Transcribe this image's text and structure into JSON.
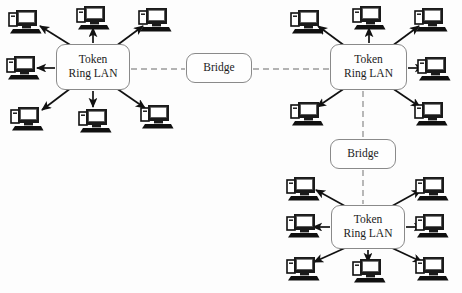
{
  "diagram": {
    "type": "network-topology",
    "background_color": "#fdfdfd",
    "node_border_color": "#8a8a8a",
    "solid_link_color": "#111111",
    "dashed_link_color": "#9a9a9a",
    "labels": {
      "lan": "Token Ring LAN",
      "lan_line1": "Token",
      "lan_line2": "Ring LAN",
      "bridge": "Bridge"
    },
    "nodes": [
      {
        "id": "lan-left",
        "kind": "lan",
        "label_line1": "Token",
        "label_line2": "Ring LAN",
        "x": 56,
        "y": 44,
        "w": 74,
        "h": 46
      },
      {
        "id": "bridge-top",
        "kind": "bridge",
        "label": "Bridge",
        "x": 186,
        "y": 53,
        "w": 66,
        "h": 30
      },
      {
        "id": "lan-right",
        "kind": "lan",
        "label_line1": "Token",
        "label_line2": "Ring LAN",
        "x": 330,
        "y": 44,
        "w": 77,
        "h": 46
      },
      {
        "id": "bridge-bottom",
        "kind": "bridge",
        "label": "Bridge",
        "x": 330,
        "y": 139,
        "w": 66,
        "h": 30
      },
      {
        "id": "lan-bottom",
        "kind": "lan",
        "label_line1": "Token",
        "label_line2": "Ring LAN",
        "x": 331,
        "y": 205,
        "w": 74,
        "h": 44
      }
    ],
    "dashed_links": [
      {
        "id": "link-lan-left-bridge-top",
        "from": "lan-left",
        "to": "bridge-top",
        "x1": 131,
        "y1": 69,
        "x2": 185,
        "y2": 69
      },
      {
        "id": "link-bridge-top-lan-right",
        "from": "bridge-top",
        "to": "lan-right",
        "x1": 253,
        "y1": 69,
        "x2": 329,
        "y2": 69
      },
      {
        "id": "link-lan-right-bridge-bottom",
        "from": "lan-right",
        "to": "bridge-bottom",
        "x1": 363,
        "y1": 91,
        "x2": 363,
        "y2": 138
      },
      {
        "id": "link-bridge-bottom-lan-bottom",
        "from": "bridge-bottom",
        "to": "lan-bottom",
        "x1": 363,
        "y1": 170,
        "x2": 363,
        "y2": 204
      }
    ],
    "clusters": [
      {
        "id": "cluster-left",
        "lan": "lan-left",
        "station_count": 6,
        "stations": [
          {
            "id": "pc-left-tl",
            "x": 8,
            "y": 8,
            "arrow_from": [
              72,
              46
            ],
            "arrow_to": [
              40,
              26
            ]
          },
          {
            "id": "pc-left-tc",
            "x": 76,
            "y": 4,
            "arrow_from": [
              93,
              43
            ],
            "arrow_to": [
              93,
              28
            ]
          },
          {
            "id": "pc-left-tr",
            "x": 138,
            "y": 6,
            "arrow_from": [
              116,
              46
            ],
            "arrow_to": [
              143,
              26
            ]
          },
          {
            "id": "pc-left-ml",
            "x": 6,
            "y": 54,
            "arrow_from": [
              55,
              68
            ],
            "arrow_to": [
              37,
              68
            ]
          },
          {
            "id": "pc-left-bl",
            "x": 10,
            "y": 105,
            "arrow_from": [
              71,
              88
            ],
            "arrow_to": [
              42,
              110
            ]
          },
          {
            "id": "pc-left-bc",
            "x": 78,
            "y": 107,
            "arrow_from": [
              93,
              91
            ],
            "arrow_to": [
              93,
              107
            ]
          },
          {
            "id": "pc-left-br",
            "x": 140,
            "y": 103,
            "arrow_from": [
              116,
              88
            ],
            "arrow_to": [
              145,
              108
            ]
          }
        ]
      },
      {
        "id": "cluster-right",
        "lan": "lan-right",
        "station_count": 6,
        "stations": [
          {
            "id": "pc-right-tl",
            "x": 290,
            "y": 8,
            "arrow_from": [
              345,
              46
            ],
            "arrow_to": [
              318,
              26
            ]
          },
          {
            "id": "pc-right-tc",
            "x": 352,
            "y": 4,
            "arrow_from": [
              369,
              43
            ],
            "arrow_to": [
              369,
              28
            ]
          },
          {
            "id": "pc-right-tr",
            "x": 414,
            "y": 6,
            "arrow_from": [
              392,
              46
            ],
            "arrow_to": [
              419,
              26
            ]
          },
          {
            "id": "pc-right-mr",
            "x": 417,
            "y": 55,
            "arrow_from": [
              408,
              68
            ],
            "arrow_to": [
              424,
              68
            ]
          },
          {
            "id": "pc-right-bl",
            "x": 290,
            "y": 100,
            "arrow_from": [
              345,
              88
            ],
            "arrow_to": [
              317,
              107
            ]
          },
          {
            "id": "pc-right-br",
            "x": 414,
            "y": 100,
            "arrow_from": [
              392,
              88
            ],
            "arrow_to": [
              420,
              107
            ]
          }
        ]
      },
      {
        "id": "cluster-bottom",
        "lan": "lan-bottom",
        "station_count": 8,
        "stations": [
          {
            "id": "pc-bottom-tl",
            "x": 286,
            "y": 175,
            "arrow_from": [
              345,
              206
            ],
            "arrow_to": [
              316,
              190
            ]
          },
          {
            "id": "pc-bottom-tr",
            "x": 415,
            "y": 175,
            "arrow_from": [
              392,
              206
            ],
            "arrow_to": [
              421,
              190
            ]
          },
          {
            "id": "pc-bottom-ml",
            "x": 286,
            "y": 212,
            "arrow_from": [
              330,
              227
            ],
            "arrow_to": [
              313,
              227
            ]
          },
          {
            "id": "pc-bottom-mr",
            "x": 415,
            "y": 212,
            "arrow_from": [
              406,
              227
            ],
            "arrow_to": [
              423,
              227
            ]
          },
          {
            "id": "pc-bottom-bl",
            "x": 286,
            "y": 255,
            "arrow_from": [
              345,
              248
            ],
            "arrow_to": [
              314,
              262
            ]
          },
          {
            "id": "pc-bottom-bc",
            "x": 352,
            "y": 257,
            "arrow_from": [
              368,
              250
            ],
            "arrow_to": [
              368,
              262
            ]
          },
          {
            "id": "pc-bottom-br",
            "x": 415,
            "y": 255,
            "arrow_from": [
              392,
              248
            ],
            "arrow_to": [
              422,
              262
            ]
          }
        ]
      }
    ]
  }
}
